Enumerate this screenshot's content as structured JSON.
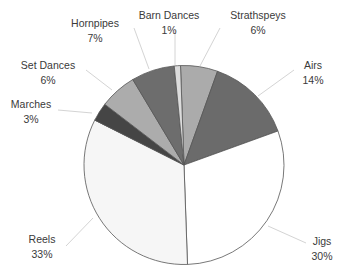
{
  "chart_data": {
    "type": "pie",
    "title": "",
    "categories": [
      "Strathspeys",
      "Airs",
      "Jigs",
      "Reels",
      "Marches",
      "Set Dances",
      "Hornpipes",
      "Barn Dances"
    ],
    "values": [
      6,
      14,
      30,
      33,
      3,
      6,
      7,
      1
    ],
    "value_labels": [
      "6%",
      "14%",
      "30%",
      "33%",
      "3%",
      "6%",
      "7%",
      "1%"
    ],
    "colors": [
      "#ababab",
      "#6b6b6b",
      "#ffffff",
      "#f6f6f6",
      "#454545",
      "#acacac",
      "#6d6d6d",
      "#dcdcdc"
    ],
    "start_angle_deg": -2,
    "direction": "clockwise",
    "legend": "none",
    "data_labels": "outside with leader lines",
    "center": [
      184,
      165
    ],
    "radius": 100
  },
  "labels": [
    {
      "name": "Strathspeys",
      "pct": "6%",
      "x": 258,
      "y": 8,
      "lx": 200,
      "ly": 66
    },
    {
      "name": "Airs",
      "pct": "14%",
      "x": 313,
      "y": 58,
      "lx": 258,
      "ly": 96
    },
    {
      "name": "Jigs",
      "pct": "30%",
      "x": 322,
      "y": 234,
      "lx": 268,
      "ly": 226
    },
    {
      "name": "Reels",
      "pct": "33%",
      "x": 42,
      "y": 232,
      "lx": 93,
      "ly": 218
    },
    {
      "name": "Marches",
      "pct": "3%",
      "x": 31,
      "y": 97,
      "lx": 92,
      "ly": 113
    },
    {
      "name": "Set Dances",
      "pct": "6%",
      "x": 48,
      "y": 58,
      "lx": 112,
      "ly": 90
    },
    {
      "name": "Hornpipes",
      "pct": "7%",
      "x": 95,
      "y": 16,
      "lx": 149,
      "ly": 69
    },
    {
      "name": "Barn Dances",
      "pct": "1%",
      "x": 169,
      "y": 8,
      "lx": 175,
      "ly": 65
    }
  ]
}
